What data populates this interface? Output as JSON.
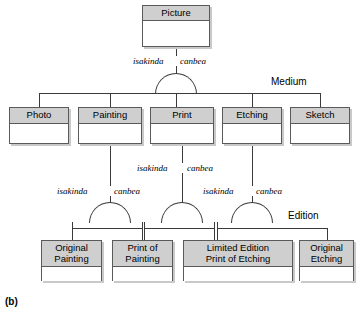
{
  "figure": {
    "caption": "(b)"
  },
  "entities": [
    {
      "id": "picture",
      "label": "Picture",
      "x": 142,
      "y": 5,
      "w": 68,
      "h": 42,
      "header_h": 15
    },
    {
      "id": "photo",
      "label": "Photo",
      "x": 9,
      "y": 107,
      "w": 60,
      "h": 37,
      "header_h": 16
    },
    {
      "id": "painting",
      "label": "Painting",
      "x": 78,
      "y": 107,
      "w": 64,
      "h": 37,
      "header_h": 16
    },
    {
      "id": "print",
      "label": "Print",
      "x": 150,
      "y": 107,
      "w": 64,
      "h": 37,
      "header_h": 16
    },
    {
      "id": "etching",
      "label": "Etching",
      "x": 222,
      "y": 107,
      "w": 60,
      "h": 37,
      "header_h": 16
    },
    {
      "id": "sketch",
      "label": "Sketch",
      "x": 290,
      "y": 107,
      "w": 60,
      "h": 37,
      "header_h": 16
    },
    {
      "id": "original-painting",
      "label": "Original\nPainting",
      "x": 41,
      "y": 240,
      "w": 61,
      "h": 41,
      "header_h": 26
    },
    {
      "id": "print-of-painting",
      "label": "Print of\nPainting",
      "x": 112,
      "y": 240,
      "w": 61,
      "h": 41,
      "header_h": 26
    },
    {
      "id": "limited-edition-print-of-etching",
      "label": "Limited Edition\nPrint of Etching",
      "x": 183,
      "y": 240,
      "w": 110,
      "h": 41,
      "header_h": 26
    },
    {
      "id": "original-etching",
      "label": "Original\nEtching",
      "x": 299,
      "y": 240,
      "w": 55,
      "h": 41,
      "header_h": 26
    }
  ],
  "relationship_labels": [
    {
      "id": "r1-isakinda",
      "text": "isakinda",
      "x": 133,
      "y": 56
    },
    {
      "id": "r1-canbea",
      "text": "canbea",
      "x": 178,
      "y": 56
    },
    {
      "id": "r2-isakinda",
      "text": "isakinda",
      "x": 55,
      "y": 186
    },
    {
      "id": "r2-canbea",
      "text": "canbea",
      "x": 101,
      "y": 186
    },
    {
      "id": "r3-isakinda",
      "text": "isakinda",
      "x": 135,
      "y": 163
    },
    {
      "id": "r3-canbea",
      "text": "canbea",
      "x": 182,
      "y": 163
    },
    {
      "id": "r4-isakinda",
      "text": "isakinda",
      "x": 200,
      "y": 186
    },
    {
      "id": "r4-canbea",
      "text": "canbea",
      "x": 248,
      "y": 186
    }
  ],
  "discriminators": [
    {
      "id": "medium",
      "text": "Medium",
      "x": 270,
      "y": 76
    },
    {
      "id": "edition",
      "text": "Edition",
      "x": 286,
      "y": 210
    }
  ],
  "colors": {
    "header_fill": "#cfcfcf",
    "box_fill": "#ffffff",
    "line": "#3a3a3a",
    "border": "#5a5a5a",
    "shadow": "#c9c9c9",
    "background": "#ffffff"
  },
  "connectors": {
    "level1": {
      "stem_from_picture": {
        "x": 176,
        "y": 47,
        "h": 9
      },
      "stem_to_arc": {
        "x": 176,
        "y": 66,
        "h": 7
      },
      "arc": {
        "x": 155,
        "y": 73,
        "w": 42,
        "h": 21
      },
      "bus": {
        "x": 39,
        "y": 93,
        "w": 282
      },
      "drops": [
        39,
        110,
        176,
        252,
        320
      ]
    },
    "level2_painting": {
      "parent_stem": {
        "x": 110,
        "y": 144,
        "h": 42
      },
      "stem_to_arc": {
        "x": 110,
        "y": 196,
        "h": 6
      },
      "arc": {
        "x": 89,
        "y": 202,
        "w": 42,
        "h": 21
      },
      "bus": {
        "x": 72,
        "y": 228,
        "w": 70
      },
      "drops": [
        72,
        142
      ]
    },
    "level2_print": {
      "parent_stem": {
        "x": 182,
        "y": 144,
        "h": 19
      },
      "stem_to_arc": {
        "x": 182,
        "y": 173,
        "h": 29
      },
      "arc": {
        "x": 161,
        "y": 202,
        "w": 42,
        "h": 21
      },
      "bus": {
        "x": 144,
        "y": 228,
        "w": 70
      },
      "drops": [
        144,
        214
      ]
    },
    "level2_etching": {
      "parent_stem": {
        "x": 252,
        "y": 144,
        "h": 42
      },
      "stem_to_arc": {
        "x": 252,
        "y": 196,
        "h": 6
      },
      "arc": {
        "x": 231,
        "y": 202,
        "w": 42,
        "h": 21
      },
      "bus": {
        "x": 217,
        "y": 228,
        "w": 110
      },
      "drops": [
        217,
        327
      ]
    }
  }
}
